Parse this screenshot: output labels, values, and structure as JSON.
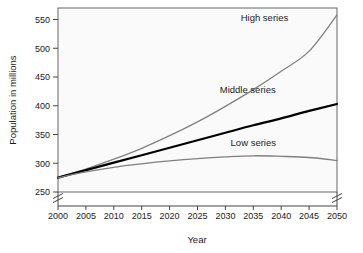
{
  "chart_data": {
    "type": "line",
    "title": "",
    "xlabel": "Year",
    "ylabel": "Population in millions",
    "xlim": [
      2000,
      2050
    ],
    "ylim": [
      250,
      570
    ],
    "yaxis_break": true,
    "xaxis_break": true,
    "grid": false,
    "legend_position": "inline-right",
    "background": "#f2f2f2",
    "plot_background": "#fafafa",
    "frame_color": "#555555",
    "x": [
      2000,
      2005,
      2010,
      2015,
      2020,
      2025,
      2030,
      2035,
      2040,
      2045,
      2050
    ],
    "xtick_labels": [
      "2000",
      "2005",
      "2010",
      "2015",
      "2020",
      "2025",
      "2030",
      "2035",
      "2040",
      "2045",
      "2050"
    ],
    "ytick_values": [
      250,
      300,
      350,
      400,
      450,
      500,
      550
    ],
    "ytick_labels": [
      "250",
      "300",
      "350",
      "400",
      "450",
      "500",
      "550"
    ],
    "series": [
      {
        "name": "High series",
        "label": "High series",
        "color": "#808080",
        "width": 1.3,
        "values": [
          275,
          290,
          307,
          326,
          348,
          372,
          399,
          428,
          460,
          495,
          558
        ]
      },
      {
        "name": "Middle series",
        "label": "Middle series",
        "color": "#000000",
        "width": 2.2,
        "values": [
          275,
          288,
          301,
          314,
          327,
          340,
          353,
          366,
          378,
          391,
          403
        ]
      },
      {
        "name": "Low series",
        "label": "Low series",
        "color": "#808080",
        "width": 1.3,
        "values": [
          275,
          285,
          293,
          299,
          304,
          308,
          311,
          313,
          312,
          310,
          305
        ]
      }
    ],
    "annotations": [
      {
        "text": "High series",
        "x": 2037,
        "y": 548
      },
      {
        "text": "Middle series",
        "x": 2034,
        "y": 422
      },
      {
        "text": "Low series",
        "x": 2035,
        "y": 330
      }
    ]
  }
}
